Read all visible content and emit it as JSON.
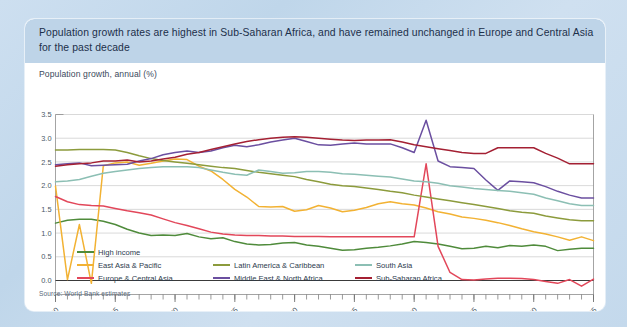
{
  "card": {
    "title": "Population growth rates are highest in Sub-Saharan Africa, and have remained unchanged in Europe and Central Asia for the past decade",
    "axis_title": "Population growth, annual (%)",
    "source": "Source: World Bank estimates",
    "title_band_color": "#bed4e8",
    "plate_color": "#ffffff",
    "page_background": "#c6dbee"
  },
  "chart_data": {
    "type": "line",
    "title": "Population growth, annual (%)",
    "xlabel": "",
    "ylabel": "Population growth, annual (%)",
    "ylim": [
      0.0,
      3.5
    ],
    "xlim": [
      1960,
      2005
    ],
    "ytick_labels": [
      "0.0",
      "0.5",
      "1.0",
      "1.5",
      "2.0",
      "2.5",
      "3.0",
      "3.5"
    ],
    "ytick_values": [
      0.0,
      0.5,
      1.0,
      1.5,
      2.0,
      2.5,
      3.0,
      3.5
    ],
    "xtick_labels": [
      "1960",
      "1965",
      "1970",
      "1975",
      "1980",
      "1985",
      "1990",
      "1995",
      "2000",
      "2005"
    ],
    "xtick_values": [
      1960,
      1965,
      1970,
      1975,
      1980,
      1985,
      1990,
      1995,
      2000,
      2005
    ],
    "grid": true,
    "legend_position": "bottom",
    "zero_line": 0.0,
    "x": [
      1960,
      1961,
      1962,
      1963,
      1964,
      1965,
      1966,
      1967,
      1968,
      1969,
      1970,
      1971,
      1972,
      1973,
      1974,
      1975,
      1976,
      1977,
      1978,
      1979,
      1980,
      1981,
      1982,
      1983,
      1984,
      1985,
      1986,
      1987,
      1988,
      1989,
      1990,
      1991,
      1992,
      1993,
      1994,
      1995,
      1996,
      1997,
      1998,
      1999,
      2000,
      2001,
      2002,
      2003,
      2004,
      2005
    ],
    "series": [
      {
        "name": "High income",
        "color": "#4f8b3b",
        "values": [
          1.21,
          1.27,
          1.29,
          1.29,
          1.25,
          1.18,
          1.08,
          1.0,
          0.95,
          0.96,
          0.95,
          0.99,
          0.92,
          0.88,
          0.9,
          0.82,
          0.77,
          0.75,
          0.76,
          0.79,
          0.8,
          0.75,
          0.72,
          0.68,
          0.64,
          0.65,
          0.68,
          0.7,
          0.73,
          0.77,
          0.82,
          0.8,
          0.77,
          0.72,
          0.67,
          0.68,
          0.72,
          0.69,
          0.74,
          0.72,
          0.75,
          0.72,
          0.63,
          0.66,
          0.68,
          0.68
        ]
      },
      {
        "name": "East Asia & Pacific",
        "color": "#f2b233",
        "values": [
          1.99,
          0.02,
          1.18,
          -0.06,
          2.42,
          2.48,
          2.5,
          2.43,
          2.47,
          2.52,
          2.56,
          2.55,
          2.41,
          2.31,
          2.13,
          1.92,
          1.76,
          1.56,
          1.55,
          1.56,
          1.46,
          1.49,
          1.58,
          1.53,
          1.45,
          1.48,
          1.54,
          1.62,
          1.66,
          1.62,
          1.59,
          1.53,
          1.45,
          1.4,
          1.34,
          1.31,
          1.27,
          1.22,
          1.16,
          1.09,
          1.03,
          0.98,
          0.92,
          0.85,
          0.92,
          0.84
        ]
      },
      {
        "name": "Europe & Central Asia",
        "color": "#e2475a",
        "values": [
          1.77,
          1.66,
          1.6,
          1.58,
          1.57,
          1.52,
          1.47,
          1.43,
          1.38,
          1.3,
          1.22,
          1.16,
          1.09,
          1.02,
          0.98,
          0.96,
          0.95,
          0.95,
          0.94,
          0.94,
          0.93,
          0.93,
          0.93,
          0.92,
          0.92,
          0.92,
          0.92,
          0.92,
          0.92,
          0.92,
          0.92,
          2.46,
          0.72,
          0.17,
          0.02,
          0.01,
          0.03,
          0.05,
          0.05,
          0.04,
          0.02,
          -0.02,
          -0.06,
          0.02,
          -0.12,
          0.03
        ]
      },
      {
        "name": "Latin America & Caribbean",
        "color": "#8c9b3c",
        "values": [
          2.75,
          2.75,
          2.76,
          2.76,
          2.76,
          2.75,
          2.7,
          2.63,
          2.57,
          2.53,
          2.5,
          2.47,
          2.44,
          2.41,
          2.38,
          2.36,
          2.32,
          2.28,
          2.25,
          2.22,
          2.19,
          2.13,
          2.08,
          2.03,
          2.0,
          1.98,
          1.95,
          1.92,
          1.88,
          1.85,
          1.8,
          1.76,
          1.72,
          1.68,
          1.64,
          1.6,
          1.56,
          1.52,
          1.47,
          1.44,
          1.42,
          1.36,
          1.32,
          1.28,
          1.26,
          1.26
        ]
      },
      {
        "name": "Middle East & North Africa",
        "color": "#6b4fa0",
        "values": [
          2.44,
          2.46,
          2.48,
          2.42,
          2.43,
          2.44,
          2.45,
          2.52,
          2.57,
          2.65,
          2.7,
          2.73,
          2.7,
          2.73,
          2.8,
          2.85,
          2.82,
          2.86,
          2.92,
          2.96,
          3.0,
          2.93,
          2.86,
          2.85,
          2.88,
          2.9,
          2.88,
          2.88,
          2.88,
          2.8,
          2.7,
          3.38,
          2.52,
          2.4,
          2.38,
          2.36,
          2.12,
          1.9,
          2.1,
          2.08,
          2.06,
          1.98,
          1.88,
          1.8,
          1.74,
          1.74
        ]
      },
      {
        "name": "South Asia",
        "color": "#8cbfb4",
        "values": [
          2.08,
          2.1,
          2.13,
          2.2,
          2.26,
          2.3,
          2.33,
          2.36,
          2.38,
          2.4,
          2.4,
          2.4,
          2.38,
          2.33,
          2.28,
          2.24,
          2.22,
          2.33,
          2.3,
          2.26,
          2.27,
          2.3,
          2.3,
          2.28,
          2.25,
          2.24,
          2.22,
          2.2,
          2.18,
          2.14,
          2.1,
          2.08,
          2.05,
          2.0,
          1.97,
          1.94,
          1.92,
          1.9,
          1.88,
          1.85,
          1.82,
          1.74,
          1.68,
          1.62,
          1.58,
          1.58
        ]
      },
      {
        "name": "Sub-Saharan Africa",
        "color": "#a42033",
        "values": [
          2.41,
          2.44,
          2.46,
          2.48,
          2.52,
          2.52,
          2.54,
          2.5,
          2.52,
          2.56,
          2.6,
          2.66,
          2.7,
          2.76,
          2.82,
          2.88,
          2.93,
          2.97,
          3.0,
          3.02,
          3.03,
          3.02,
          3.0,
          2.98,
          2.96,
          2.95,
          2.96,
          2.96,
          2.97,
          2.92,
          2.86,
          2.82,
          2.78,
          2.74,
          2.7,
          2.68,
          2.68,
          2.8,
          2.8,
          2.8,
          2.8,
          2.68,
          2.58,
          2.46,
          2.46,
          2.46
        ]
      }
    ],
    "legend": [
      {
        "name": "High income",
        "color": "#4f8b3b",
        "col": 0,
        "row": 0
      },
      {
        "name": "East Asia & Pacific",
        "color": "#f2b233",
        "col": 0,
        "row": 1
      },
      {
        "name": "Europe & Central Asia",
        "color": "#e2475a",
        "col": 0,
        "row": 2
      },
      {
        "name": "Latin America & Caribbean",
        "color": "#8c9b3c",
        "col": 1,
        "row": 1
      },
      {
        "name": "Middle East & North Africa",
        "color": "#6b4fa0",
        "col": 1,
        "row": 2
      },
      {
        "name": "South Asia",
        "color": "#8cbfb4",
        "col": 2,
        "row": 1
      },
      {
        "name": "Sub-Saharan Africa",
        "color": "#a42033",
        "col": 2,
        "row": 2
      }
    ]
  }
}
